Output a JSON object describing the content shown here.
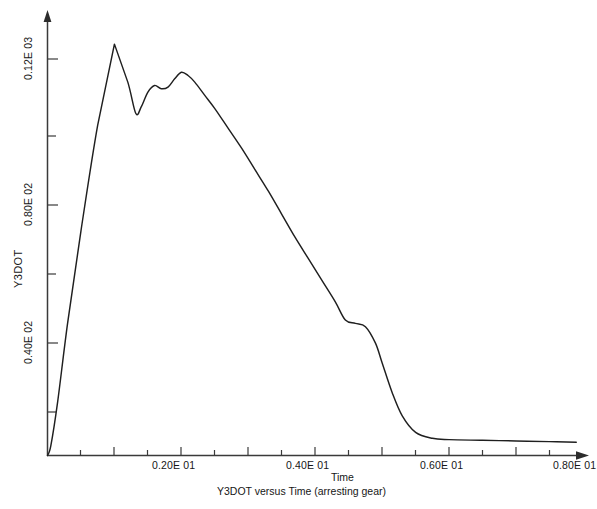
{
  "chart_data": {
    "type": "line",
    "title": "",
    "caption": "Y3DOT versus Time (arresting gear)",
    "xlabel": "Time",
    "ylabel": "Y3DOT",
    "grid": false,
    "legend": "none",
    "xlim": [
      0,
      8.5
    ],
    "ylim": [
      0,
      140
    ],
    "x_tick_labels": [
      "0.20E 01",
      "0.40E 01",
      "0.60E 01",
      "0.80E 01"
    ],
    "x_tick_values": [
      2.0,
      4.0,
      6.0,
      8.0
    ],
    "x_minor_tick_values": [
      0.5,
      1.0,
      1.5,
      2.5,
      3.0,
      3.5,
      4.5,
      5.0,
      5.5,
      6.5,
      7.0,
      7.5
    ],
    "y_tick_labels": [
      "0.40E 02",
      "0.80E 02",
      "0.12E 03"
    ],
    "y_tick_values": [
      40.0,
      80.0,
      120.0
    ],
    "y_minor_tick_values": [
      20.0,
      60.0,
      100.0
    ],
    "series": [
      {
        "name": "Y3DOT",
        "x": [
          0.0,
          0.05,
          0.15,
          0.3,
          0.5,
          0.75,
          1.0,
          1.2,
          1.32,
          1.4,
          1.5,
          1.6,
          1.7,
          1.8,
          1.9,
          2.0,
          2.1,
          2.2,
          2.35,
          2.5,
          2.7,
          2.9,
          3.1,
          3.3,
          3.5,
          3.7,
          3.9,
          4.1,
          4.3,
          4.45,
          4.6,
          4.75,
          4.9,
          5.0,
          5.15,
          5.3,
          5.5,
          5.75,
          6.0,
          6.5,
          7.0,
          7.5,
          7.9
        ],
        "y": [
          0.0,
          3.0,
          16.0,
          40.0,
          68.0,
          100.0,
          124.5,
          113.0,
          103.5,
          105.5,
          110.0,
          112.0,
          111.0,
          111.5,
          114.0,
          116.0,
          115.0,
          113.0,
          109.0,
          105.0,
          99.0,
          93.0,
          86.5,
          80.0,
          73.0,
          66.0,
          59.5,
          53.0,
          46.5,
          41.0,
          40.0,
          39.0,
          34.0,
          28.0,
          19.0,
          12.0,
          7.0,
          5.2,
          4.8,
          4.6,
          4.4,
          4.2,
          4.0
        ]
      }
    ],
    "annotations": [
      {
        "text": "first peak",
        "x": 1.0,
        "y": 124.5
      },
      {
        "text": "local minimum",
        "x": 1.32,
        "y": 103.5
      },
      {
        "text": "secondary peak",
        "x": 1.95,
        "y": 116.0
      },
      {
        "text": "shoulder / kink",
        "x": 4.55,
        "y": 40.0
      },
      {
        "text": "flat tail",
        "x": 6.0,
        "y": 4.8
      }
    ]
  },
  "axes": {
    "x_title": "Time",
    "y_title": "Y3DOT",
    "x_tick_labels": [
      "0.20E 01",
      "0.40E 01",
      "0.60E 01",
      "0.80E 01"
    ],
    "y_tick_labels": [
      "0.40E 02",
      "0.80E 02",
      "0.12E 03"
    ]
  },
  "figure": {
    "caption": "Y3DOT versus Time (arresting gear)",
    "footer_ghost": "",
    "line_color": "#1f1f1f",
    "axis_color": "#3a3a3a",
    "background": "#ffffff"
  }
}
